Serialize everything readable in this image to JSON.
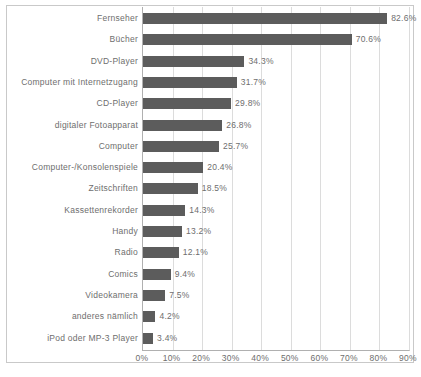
{
  "chart_data": {
    "type": "bar",
    "orientation": "horizontal",
    "title": "",
    "subtitle": "",
    "xlabel": "",
    "ylabel": "",
    "xlim": [
      0,
      90
    ],
    "grid": true,
    "legend": null,
    "bar_color": "#5c5c5c",
    "categories": [
      "Fernseher",
      "Bücher",
      "DVD-Player",
      "Computer mit Internetzugang",
      "CD-Player",
      "digitaler Fotoapparat",
      "Computer",
      "Computer-/Konsolenspiele",
      "Zeitschriften",
      "Kassettenrekorder",
      "Handy",
      "Radio",
      "Comics",
      "Videokamera",
      "anderes nämlich",
      "iPod oder MP-3 Player"
    ],
    "values": [
      82.6,
      70.6,
      34.3,
      31.7,
      29.8,
      26.8,
      25.7,
      20.4,
      18.5,
      14.3,
      13.2,
      12.1,
      9.4,
      7.5,
      4.2,
      3.4
    ],
    "value_labels": [
      "82.6%",
      "70.6%",
      "34.3%",
      "31.7%",
      "29.8%",
      "26.8%",
      "25.7%",
      "20.4%",
      "18.5%",
      "14.3%",
      "13.2%",
      "12.1%",
      "9.4%",
      "7.5%",
      "4.2%",
      "3.4%"
    ],
    "xticks": [
      0,
      10,
      20,
      30,
      40,
      50,
      60,
      70,
      80,
      90
    ],
    "xtick_labels": [
      "0%",
      "10%",
      "20%",
      "30%",
      "40%",
      "50%",
      "60%",
      "70%",
      "80%",
      "90%"
    ]
  },
  "caption": ""
}
